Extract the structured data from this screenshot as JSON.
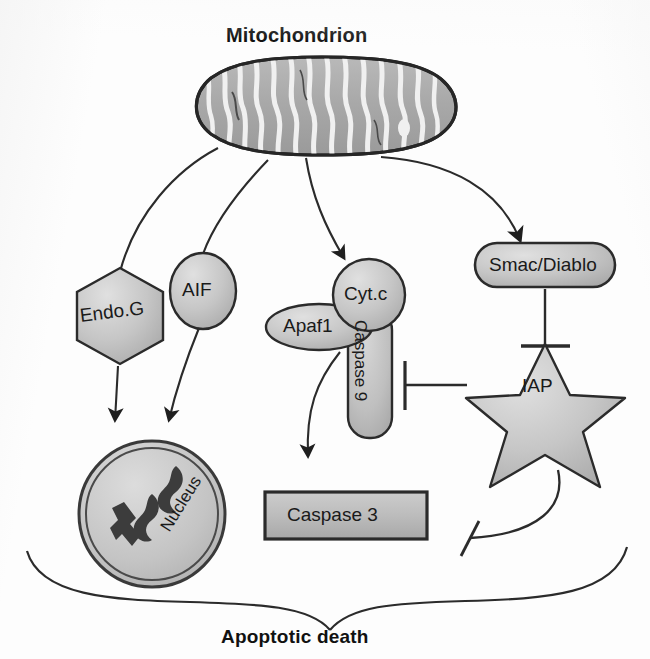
{
  "figure": {
    "title": "Mitochondrion",
    "caption": "Apoptotic death",
    "type": "biological-pathway-diagram",
    "colors": {
      "shape_fill_light": "#cfcfcf",
      "shape_fill_mid": "#bdbdbd",
      "shape_fill_dark": "#9a9a9a",
      "stroke": "#2b2b2b",
      "background": "#fdfdfd",
      "text": "#111111"
    }
  },
  "nodes": {
    "mitochondrion": {
      "label": "Mitochondrion",
      "shape": "organelle-oval-cristae"
    },
    "endog": {
      "label": "Endo.G",
      "shape": "hexagon"
    },
    "aif": {
      "label": "AIF",
      "shape": "ellipse"
    },
    "cytc": {
      "label": "Cyt.c",
      "shape": "circle"
    },
    "apaf1": {
      "label": "Apaf1",
      "shape": "ellipse"
    },
    "caspase9": {
      "label": "Caspase 9",
      "shape": "rounded-rect-vertical"
    },
    "smac": {
      "label": "Smac/Diablo",
      "shape": "pill"
    },
    "iap": {
      "label": "IAP",
      "shape": "star"
    },
    "caspase3": {
      "label": "Caspase 3",
      "shape": "rectangle"
    },
    "nucleus": {
      "label": "Nucleus",
      "shape": "circle-double-ring-with-chromosomes"
    }
  },
  "edges": [
    {
      "from": "mitochondrion",
      "to": "endog",
      "kind": "activation-arrow"
    },
    {
      "from": "mitochondrion",
      "to": "aif",
      "kind": "activation-arrow"
    },
    {
      "from": "mitochondrion",
      "to": "cytc",
      "kind": "activation-arrow"
    },
    {
      "from": "mitochondrion",
      "to": "smac",
      "kind": "activation-arrow"
    },
    {
      "from": "endog",
      "to": "nucleus",
      "kind": "activation-arrow"
    },
    {
      "from": "aif",
      "to": "nucleus",
      "kind": "activation-arrow"
    },
    {
      "from": "caspase9",
      "to": "caspase3",
      "kind": "activation-arrow"
    },
    {
      "from": "smac",
      "to": "iap",
      "kind": "inhibition-bar"
    },
    {
      "from": "iap",
      "to": "caspase9",
      "kind": "inhibition-bar"
    },
    {
      "from": "iap",
      "to": "caspase3",
      "kind": "inhibition-bar"
    }
  ],
  "outcome": {
    "label": "Apoptotic death",
    "brace": "converging-brace"
  }
}
